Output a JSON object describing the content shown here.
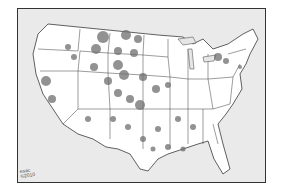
{
  "map": {
    "subject": "Contiguous United States with state boundaries and shaded density blotches",
    "credit_line1": "esac",
    "credit_line2": "©2010",
    "colors": {
      "land": "#ffffff",
      "water": "#e6e6e6",
      "border": "#3a3a3a",
      "blotch": "#6e6e6e",
      "frame": "#333333"
    }
  }
}
